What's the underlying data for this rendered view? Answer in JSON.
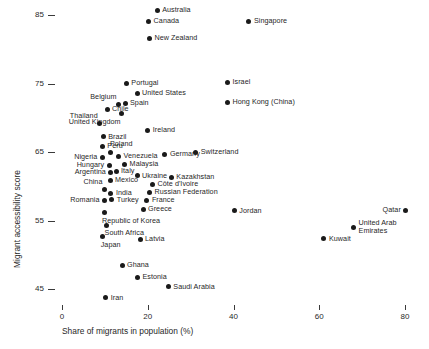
{
  "chart_data": {
    "type": "scatter",
    "title": "",
    "xlabel": "Share of migrants in population (%)",
    "ylabel": "Migrant accessibility score",
    "xlim": [
      -3,
      85
    ],
    "ylim": [
      42,
      88
    ],
    "xticks": [
      0,
      20,
      40,
      60,
      80
    ],
    "xtick_labels": [
      "0",
      "20",
      "40",
      "60",
      "80"
    ],
    "yticks": [
      45,
      55,
      65,
      75,
      85
    ],
    "ytick_labels": [
      "45",
      "55",
      "65",
      "75",
      "85"
    ],
    "grid": false,
    "legend": "none",
    "marker_color": "#1a1a1a",
    "points": [
      {
        "label": "Australia",
        "x": 22.2,
        "y": 85.6,
        "pos": "right"
      },
      {
        "label": "Canada",
        "x": 20.2,
        "y": 84.0,
        "pos": "right"
      },
      {
        "label": "Singapore",
        "x": 43.6,
        "y": 84.1,
        "pos": "right"
      },
      {
        "label": "New Zealand",
        "x": 20.4,
        "y": 81.6,
        "pos": "right"
      },
      {
        "label": "Portugal",
        "x": 15.0,
        "y": 75.0,
        "pos": "right"
      },
      {
        "label": "Israel",
        "x": 38.6,
        "y": 75.1,
        "pos": "right"
      },
      {
        "label": "United States",
        "x": 17.5,
        "y": 73.5,
        "pos": "right"
      },
      {
        "label": "Belgium",
        "x": 13.2,
        "y": 72.0,
        "pos": "above-left"
      },
      {
        "label": "Spain",
        "x": 14.7,
        "y": 72.1,
        "pos": "right"
      },
      {
        "label": "Hong Kong (China)",
        "x": 38.6,
        "y": 72.2,
        "pos": "right"
      },
      {
        "label": "Chile",
        "x": 10.5,
        "y": 71.2,
        "pos": "right"
      },
      {
        "label": "United Kingdom",
        "x": 13.9,
        "y": 70.6,
        "pos": "below-left"
      },
      {
        "label": "Thailand",
        "x": 8.8,
        "y": 69.2,
        "pos": "above-left"
      },
      {
        "label": "Ireland",
        "x": 20.0,
        "y": 68.2,
        "pos": "right"
      },
      {
        "label": "Brazil",
        "x": 9.6,
        "y": 67.2,
        "pos": "right"
      },
      {
        "label": "Peru",
        "x": 9.4,
        "y": 65.8,
        "pos": "right"
      },
      {
        "label": "Switzerland",
        "x": 31.2,
        "y": 65.0,
        "pos": "right"
      },
      {
        "label": "Poland",
        "x": 11.4,
        "y": 65.0,
        "pos": "above"
      },
      {
        "label": "Germany",
        "x": 24.0,
        "y": 64.6,
        "pos": "right"
      },
      {
        "label": "Nigeria",
        "x": 9.4,
        "y": 64.2,
        "pos": "left"
      },
      {
        "label": "Venezuela",
        "x": 13.2,
        "y": 64.3,
        "pos": "right"
      },
      {
        "label": "Hungary",
        "x": 11.0,
        "y": 63.1,
        "pos": "left"
      },
      {
        "label": "Malaysia",
        "x": 14.6,
        "y": 63.2,
        "pos": "right"
      },
      {
        "label": "Argentina",
        "x": 11.4,
        "y": 62.0,
        "pos": "left"
      },
      {
        "label": "Italy",
        "x": 12.6,
        "y": 62.2,
        "pos": "right"
      },
      {
        "label": "Ukraine",
        "x": 17.5,
        "y": 61.5,
        "pos": "right"
      },
      {
        "label": "Kazakhstan",
        "x": 25.5,
        "y": 61.3,
        "pos": "right"
      },
      {
        "label": "Mexico",
        "x": 11.2,
        "y": 60.8,
        "pos": "right"
      },
      {
        "label": "Côte d'Ivoire",
        "x": 21.1,
        "y": 60.2,
        "pos": "right"
      },
      {
        "label": "China",
        "x": 9.9,
        "y": 59.5,
        "pos": "above-left"
      },
      {
        "label": "India",
        "x": 11.4,
        "y": 59.0,
        "pos": "right"
      },
      {
        "label": "Russian Federation",
        "x": 20.4,
        "y": 59.1,
        "pos": "right"
      },
      {
        "label": "Romania",
        "x": 9.9,
        "y": 57.9,
        "pos": "left"
      },
      {
        "label": "Turkey",
        "x": 11.6,
        "y": 58.0,
        "pos": "right"
      },
      {
        "label": "France",
        "x": 19.8,
        "y": 57.9,
        "pos": "right"
      },
      {
        "label": "Greece",
        "x": 18.9,
        "y": 56.6,
        "pos": "right"
      },
      {
        "label": "Republic of Korea",
        "x": 9.8,
        "y": 56.1,
        "pos": "below"
      },
      {
        "label": "South Africa",
        "x": 10.4,
        "y": 54.3,
        "pos": "below"
      },
      {
        "label": "Japan",
        "x": 9.5,
        "y": 52.6,
        "pos": "below"
      },
      {
        "label": "Latvia",
        "x": 18.2,
        "y": 52.2,
        "pos": "right"
      },
      {
        "label": "Jordan",
        "x": 40.2,
        "y": 56.4,
        "pos": "right"
      },
      {
        "label": "Qatar",
        "x": 80.2,
        "y": 56.5,
        "pos": "left"
      },
      {
        "label": "United Arab Emirates",
        "x": 68.0,
        "y": 54.0,
        "pos": "right-2l"
      },
      {
        "label": "Kuwait",
        "x": 61.1,
        "y": 52.3,
        "pos": "right"
      },
      {
        "label": "Ghana",
        "x": 14.0,
        "y": 48.5,
        "pos": "right"
      },
      {
        "label": "Estonia",
        "x": 17.6,
        "y": 46.7,
        "pos": "right"
      },
      {
        "label": "Saudi Arabia",
        "x": 24.8,
        "y": 45.3,
        "pos": "right"
      },
      {
        "label": "Iran",
        "x": 10.2,
        "y": 43.7,
        "pos": "right"
      }
    ]
  }
}
